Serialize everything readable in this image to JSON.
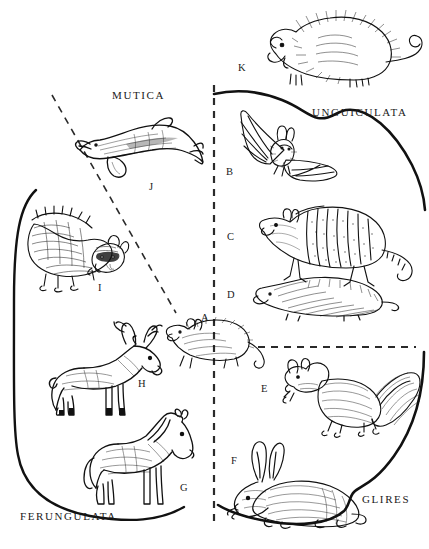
{
  "figure": {
    "type": "taxonomic-plate",
    "background_color": "#ffffff",
    "ink_color": "#1a1a1a",
    "width": 429,
    "height": 549
  },
  "group_labels": [
    {
      "id": "mutica",
      "text": "MUTICA",
      "x": 112,
      "y": 96,
      "name": "group-label-mutica"
    },
    {
      "id": "unguiculata",
      "text": "UNGUICULATA",
      "x": 312,
      "y": 113,
      "name": "group-label-unguiculata"
    },
    {
      "id": "glires",
      "text": "GLIRES",
      "x": 362,
      "y": 500,
      "name": "group-label-glires"
    },
    {
      "id": "ferungulata",
      "text": "FERUNGULATA",
      "x": 20,
      "y": 517,
      "name": "group-label-ferungulata"
    }
  ],
  "item_labels": [
    {
      "id": "A",
      "text": "A",
      "x": 201,
      "y": 312,
      "animal": "opossum"
    },
    {
      "id": "B",
      "text": "B",
      "x": 226,
      "y": 166,
      "animal": "bat"
    },
    {
      "id": "C",
      "text": "C",
      "x": 227,
      "y": 231,
      "animal": "armadillo"
    },
    {
      "id": "D",
      "text": "D",
      "x": 227,
      "y": 289,
      "animal": "mole"
    },
    {
      "id": "E",
      "text": "E",
      "x": 261,
      "y": 383,
      "animal": "squirrel"
    },
    {
      "id": "F",
      "text": "F",
      "x": 231,
      "y": 455,
      "animal": "rabbit"
    },
    {
      "id": "G",
      "text": "G",
      "x": 180,
      "y": 482,
      "animal": "horse"
    },
    {
      "id": "H",
      "text": "H",
      "x": 138,
      "y": 378,
      "animal": "deer"
    },
    {
      "id": "I",
      "text": "I",
      "x": 98,
      "y": 282,
      "animal": "raccoon"
    },
    {
      "id": "J",
      "text": "J",
      "x": 149,
      "y": 181,
      "animal": "dolphin"
    },
    {
      "id": "K",
      "text": "K",
      "x": 238,
      "y": 62,
      "animal": "shrew-opossum"
    }
  ],
  "dividers": [
    {
      "id": "vertical-dashed",
      "style": "dashed",
      "x1": 214,
      "y1": 85,
      "x2": 214,
      "y2": 521
    },
    {
      "id": "diagonal-dashed",
      "style": "dashed",
      "x1": 52,
      "y1": 95,
      "x2": 176,
      "y2": 313
    },
    {
      "id": "horizontal-dashed",
      "style": "dashed",
      "x1": 258,
      "y1": 347,
      "x2": 416,
      "y2": 347
    }
  ],
  "brackets": [
    {
      "id": "ferungulata-bracket",
      "name": "bracket-ferungulata"
    },
    {
      "id": "unguiculata-bracket",
      "name": "bracket-unguiculata"
    },
    {
      "id": "glires-bracket",
      "name": "bracket-glires"
    }
  ],
  "animals": [
    {
      "id": "shrew-opossum",
      "name": "animal-shrew-opossum",
      "label": "K",
      "group": "unguiculata"
    },
    {
      "id": "bat",
      "name": "animal-bat",
      "label": "B",
      "group": "unguiculata"
    },
    {
      "id": "armadillo",
      "name": "animal-armadillo",
      "label": "C",
      "group": "unguiculata"
    },
    {
      "id": "mole",
      "name": "animal-mole",
      "label": "D",
      "group": "unguiculata"
    },
    {
      "id": "opossum",
      "name": "animal-opossum",
      "label": "A",
      "group": "unguiculata"
    },
    {
      "id": "squirrel",
      "name": "animal-squirrel",
      "label": "E",
      "group": "glires"
    },
    {
      "id": "rabbit",
      "name": "animal-rabbit",
      "label": "F",
      "group": "glires"
    },
    {
      "id": "horse",
      "name": "animal-horse",
      "label": "G",
      "group": "ferungulata"
    },
    {
      "id": "deer",
      "name": "animal-deer",
      "label": "H",
      "group": "ferungulata"
    },
    {
      "id": "raccoon",
      "name": "animal-raccoon",
      "label": "I",
      "group": "ferungulata"
    },
    {
      "id": "dolphin",
      "name": "animal-dolphin",
      "label": "J",
      "group": "mutica"
    }
  ]
}
